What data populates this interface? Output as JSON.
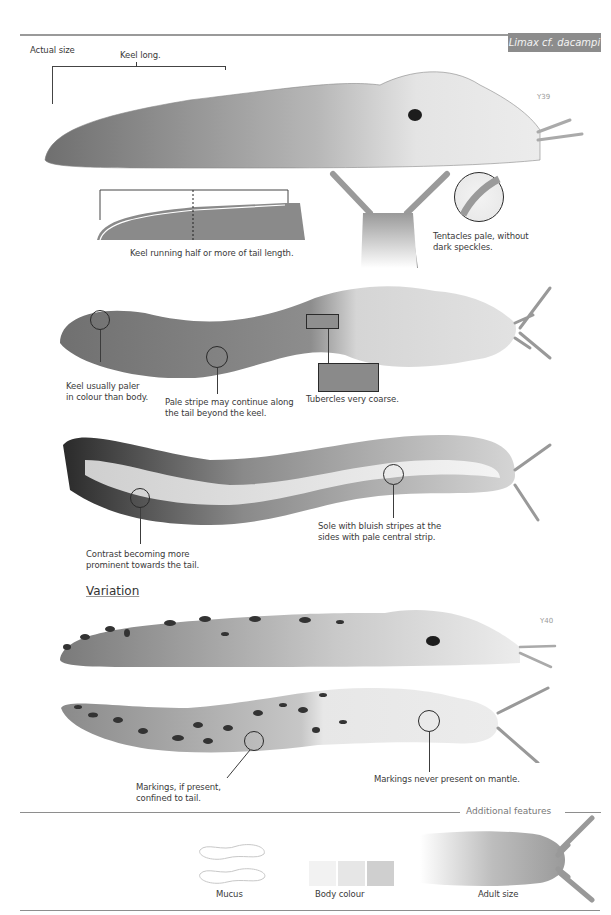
{
  "header": {
    "species_title": "Limax cf. dacampi",
    "actual_size_label": "Actual size",
    "title_bg_color": "#8c8c8c"
  },
  "figures": {
    "main_side_view": {
      "code": "Y39",
      "callout_keel": "Keel long."
    },
    "keel_diagram": {
      "caption": "Keel running half or more of tail length."
    },
    "tentacles": {
      "caption_line1": "Tentacles pale, without",
      "caption_line2": "dark speckles."
    },
    "dorsal_view": {
      "callout_keel_line1": "Keel usually paler",
      "callout_keel_line2": "in colour than body.",
      "callout_stripe_line1": "Pale stripe may continue along",
      "callout_stripe_line2": "the tail beyond the keel.",
      "callout_tubercles": "Tubercles very coarse."
    },
    "sole_view": {
      "callout_sole_line1": "Sole with bluish stripes at the",
      "callout_sole_line2": "sides with pale central strip.",
      "callout_contrast_line1": "Contrast becoming more",
      "callout_contrast_line2": "prominent towards the tail."
    }
  },
  "variation": {
    "heading": "Variation",
    "spotted_side_view": {
      "code": "Y40"
    },
    "spotted_dorsal_view": {
      "callout_markings_line1": "Markings, if present,",
      "callout_markings_line2": "confined to tail.",
      "callout_mantle": "Markings never present on mantle."
    }
  },
  "additional_features": {
    "heading": "Additional features",
    "items": [
      {
        "label": "Mucus",
        "icon": "mucus-icon"
      },
      {
        "label": "Body colour",
        "icon": "body-colour-swatches"
      },
      {
        "label": "Adult size",
        "icon": "adult-size-silhouette"
      }
    ],
    "swatch_colors": [
      "#f2f2f2",
      "#e6e6e6",
      "#cfcfcf"
    ]
  }
}
